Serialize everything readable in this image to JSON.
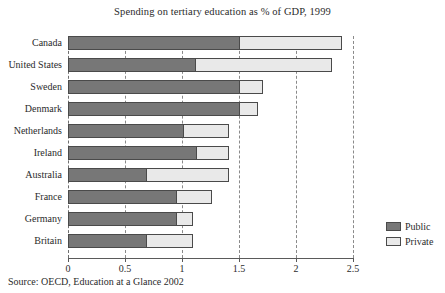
{
  "chart_data": {
    "type": "bar",
    "orientation": "horizontal",
    "stacked": true,
    "title": "Spending on tertiary education as % of GDP, 1999",
    "xlabel": "",
    "ylabel": "",
    "xlim": [
      0,
      2.5
    ],
    "xticks": [
      "0",
      "0.5",
      "1",
      "1.5",
      "2",
      "2.5"
    ],
    "xtick_values": [
      0,
      0.5,
      1,
      1.5,
      2,
      2.5
    ],
    "grid": true,
    "grid_style": "dashed vertical",
    "legend_position": "right-bottom",
    "categories": [
      "Canada",
      "United States",
      "Sweden",
      "Denmark",
      "Netherlands",
      "Ireland",
      "Australia",
      "France",
      "Germany",
      "Britain"
    ],
    "series": [
      {
        "name": "Public",
        "color": "#777777",
        "values": [
          1.5,
          1.11,
          1.5,
          1.5,
          1.01,
          1.12,
          0.68,
          0.95,
          0.95,
          0.68
        ]
      },
      {
        "name": "Private",
        "color": "#e9e9e9",
        "values": [
          0.9,
          1.21,
          0.21,
          0.17,
          0.4,
          0.29,
          0.73,
          0.31,
          0.15,
          0.42
        ]
      }
    ],
    "totals": [
      2.4,
      2.32,
      1.71,
      1.67,
      1.41,
      1.41,
      1.41,
      1.26,
      1.1,
      1.1
    ],
    "source": "Source: OECD, Education at a Glance 2002"
  },
  "legend": {
    "items": [
      {
        "label": "Public",
        "color": "#777777"
      },
      {
        "label": "Private",
        "color": "#e9e9e9"
      }
    ]
  }
}
